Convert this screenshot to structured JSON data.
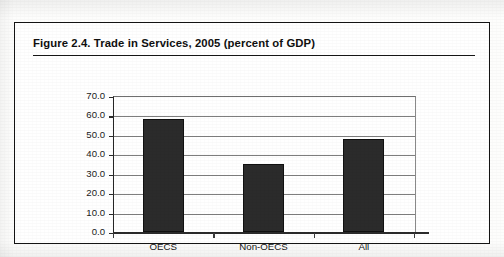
{
  "figure": {
    "title": "Figure 2.4.  Trade in Services, 2005 (percent of  GDP)"
  },
  "chart_data": {
    "type": "bar",
    "title": "Figure 2.4.  Trade in Services, 2005 (percent of  GDP)",
    "xlabel": "",
    "ylabel": "",
    "categories": [
      "OECS",
      "Non-OECS",
      "All"
    ],
    "values": [
      58.0,
      35.0,
      48.0
    ],
    "ylim": [
      0.0,
      70.0
    ],
    "ytick_step": 10.0,
    "ytick_labels": [
      "0.0",
      "10.0",
      "20.0",
      "30.0",
      "40.0",
      "50.0",
      "60.0",
      "70.0"
    ],
    "ytick_values": [
      0.0,
      10.0,
      20.0,
      30.0,
      40.0,
      50.0,
      60.0,
      70.0
    ],
    "grid": true,
    "legend": false,
    "bar_color": "#2b2b2b",
    "axis_color": "#2b2b2b",
    "grid_color": "#7e7e7e"
  }
}
